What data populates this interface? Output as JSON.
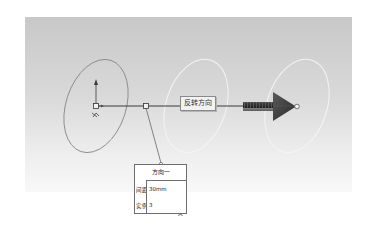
{
  "scene": {
    "reverse_direction_label": "反转方向",
    "colors": {
      "viewport_top": "#c8c8c8",
      "viewport_bottom": "#f8f8f8",
      "seed_ellipse": "#8c8c8c",
      "instance_ellipse": "#f4f4f4",
      "direction_line": "#3a3a3a",
      "arrow_head": "#3c3c3c"
    }
  },
  "callout": {
    "title": "方向一",
    "rows": [
      {
        "label": "间距:",
        "value": "30mm"
      },
      {
        "label": "实例:",
        "value": "3"
      }
    ]
  },
  "expand_caret": "^"
}
